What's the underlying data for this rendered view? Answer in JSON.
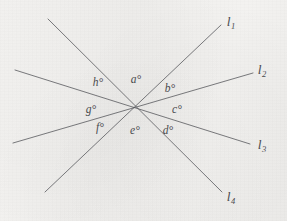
{
  "figure": {
    "kind": "geometry-diagram",
    "background_color": "#f2f1ef",
    "line_color": "#55565a",
    "text_color": "#4a4b4f",
    "intersection": {
      "x": 135,
      "y": 108
    }
  },
  "lines": [
    {
      "id": "l1",
      "label": "l",
      "subscript": "1",
      "x1": 45,
      "y1": 192,
      "x2": 221,
      "y2": 25,
      "label_x": 231,
      "label_y": 23
    },
    {
      "id": "l2",
      "label": "l",
      "subscript": "2",
      "x1": 13,
      "y1": 143,
      "x2": 253,
      "y2": 73,
      "label_x": 262,
      "label_y": 71
    },
    {
      "id": "l3",
      "label": "l",
      "subscript": "3",
      "x1": 15,
      "y1": 70,
      "x2": 250,
      "y2": 144,
      "label_x": 262,
      "label_y": 146
    },
    {
      "id": "l4",
      "label": "l",
      "subscript": "4",
      "x1": 48,
      "y1": 19,
      "x2": 222,
      "y2": 192,
      "label_x": 231,
      "label_y": 198
    }
  ],
  "angles": [
    {
      "id": "a",
      "label": "a°",
      "x": 136,
      "y": 80
    },
    {
      "id": "b",
      "label": "b°",
      "x": 170,
      "y": 89
    },
    {
      "id": "c",
      "label": "c°",
      "x": 177,
      "y": 110
    },
    {
      "id": "d",
      "label": "d°",
      "x": 168,
      "y": 131
    },
    {
      "id": "e",
      "label": "e°",
      "x": 135,
      "y": 131
    },
    {
      "id": "f",
      "label": "f°",
      "x": 100,
      "y": 128
    },
    {
      "id": "g",
      "label": "g°",
      "x": 91,
      "y": 110
    },
    {
      "id": "h",
      "label": "h°",
      "x": 98,
      "y": 83
    }
  ]
}
